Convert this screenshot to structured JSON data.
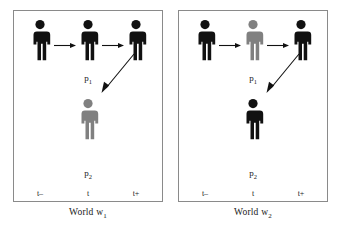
{
  "panels": [
    {
      "id": "w1",
      "caption_text": "World w",
      "caption_sub": "1",
      "person_top_label": "p",
      "person_top_label_sub": "1",
      "person_bottom_label": "p",
      "person_bottom_label_sub": "2",
      "time_labels": [
        "t–",
        "t",
        "t+"
      ],
      "figures": [
        {
          "name": "person-p1-t-minus",
          "color": "#111111"
        },
        {
          "name": "person-p1-t",
          "color": "#111111"
        },
        {
          "name": "person-p1-t-plus",
          "color": "#111111"
        },
        {
          "name": "person-p2-t",
          "color": "#808080"
        }
      ],
      "arrows": [
        {
          "name": "arrow-t-minus-to-t",
          "kind": "horizontal"
        },
        {
          "name": "arrow-t-to-t-plus",
          "kind": "horizontal"
        },
        {
          "name": "arrow-p1-to-p2",
          "kind": "diagonal"
        }
      ]
    },
    {
      "id": "w2",
      "caption_text": "World w",
      "caption_sub": "2",
      "person_top_label": "p",
      "person_top_label_sub": "1",
      "person_bottom_label": "p",
      "person_bottom_label_sub": "2",
      "time_labels": [
        "t–",
        "t",
        "t+"
      ],
      "figures": [
        {
          "name": "person-p1-t-minus",
          "color": "#111111"
        },
        {
          "name": "person-p1-t",
          "color": "#808080"
        },
        {
          "name": "person-p1-t-plus",
          "color": "#111111"
        },
        {
          "name": "person-p2-t",
          "color": "#111111"
        }
      ],
      "arrows": [
        {
          "name": "arrow-t-minus-to-t",
          "kind": "horizontal"
        },
        {
          "name": "arrow-t-to-t-plus",
          "kind": "horizontal"
        },
        {
          "name": "arrow-p1-to-p2",
          "kind": "diagonal"
        }
      ]
    }
  ],
  "colors": {
    "black_figure": "#111111",
    "gray_figure": "#808080",
    "panel_border": "#8a8a8a",
    "text": "#1a1a1a",
    "background": "#ffffff"
  }
}
